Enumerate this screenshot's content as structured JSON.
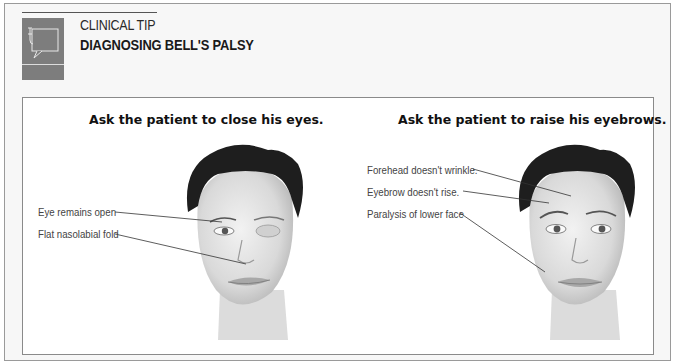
{
  "header": {
    "kicker": "CLINICAL TIP",
    "title": "DIAGNOSING BELL'S PALSY",
    "icon": "speech-bubble-stethoscope-icon"
  },
  "panels": [
    {
      "heading": "Ask the patient to close his eyes.",
      "labels": [
        "Eye remains open",
        "Flat nasolabial fold"
      ],
      "figure": "face-one-eye-open-illustration"
    },
    {
      "heading": "Ask the patient to raise his eyebrows.",
      "labels": [
        "Forehead doesn't wrinkle.",
        "Eyebrow doesn't rise.",
        "Paralysis of lower face"
      ],
      "figure": "face-raised-eyebrow-illustration"
    }
  ],
  "colors": {
    "icon_bg": "#7d7d7d",
    "border": "#8a8a8a",
    "hair": "#1e1e1e",
    "skin": "#e4e4e4"
  }
}
